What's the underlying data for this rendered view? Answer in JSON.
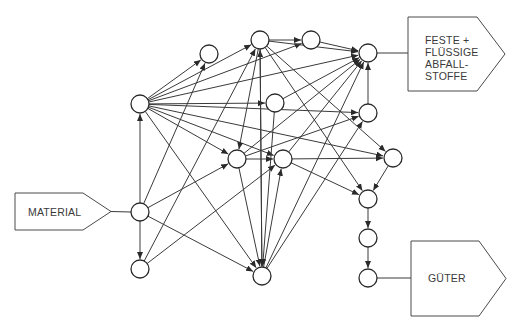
{
  "diagram": {
    "type": "process-flow-network",
    "labels": {
      "input": "MATERIAL",
      "waste_lines": [
        "FESTE +",
        "FLÜSSIGE",
        "ABFALL-",
        "STOFFE"
      ],
      "output": "GÜTER"
    },
    "boxes": [
      {
        "id": "material",
        "x": 15,
        "y": 193,
        "w": 68,
        "h": 37,
        "tip": 28,
        "dir": "right"
      },
      {
        "id": "waste",
        "x": 408,
        "y": 17,
        "w": 69,
        "h": 74,
        "tip": 28,
        "dir": "right"
      },
      {
        "id": "goods",
        "x": 411,
        "y": 241,
        "w": 68,
        "h": 75,
        "tip": 27,
        "dir": "right"
      }
    ],
    "nodes": [
      {
        "id": "A",
        "x": 140,
        "y": 104
      },
      {
        "id": "B",
        "x": 209,
        "y": 54
      },
      {
        "id": "C",
        "x": 260,
        "y": 40
      },
      {
        "id": "D",
        "x": 311,
        "y": 40
      },
      {
        "id": "E",
        "x": 368,
        "y": 53
      },
      {
        "id": "F",
        "x": 275,
        "y": 103
      },
      {
        "id": "G",
        "x": 237,
        "y": 159
      },
      {
        "id": "H",
        "x": 283,
        "y": 159
      },
      {
        "id": "I",
        "x": 368,
        "y": 113
      },
      {
        "id": "J",
        "x": 393,
        "y": 158
      },
      {
        "id": "K",
        "x": 140,
        "y": 212
      },
      {
        "id": "L",
        "x": 140,
        "y": 269
      },
      {
        "id": "M",
        "x": 262,
        "y": 276
      },
      {
        "id": "N",
        "x": 368,
        "y": 199
      },
      {
        "id": "O",
        "x": 368,
        "y": 238
      },
      {
        "id": "P",
        "x": 368,
        "y": 278
      }
    ],
    "edges": [
      [
        "A",
        "B"
      ],
      [
        "A",
        "C"
      ],
      [
        "A",
        "D"
      ],
      [
        "A",
        "E"
      ],
      [
        "A",
        "F"
      ],
      [
        "A",
        "G"
      ],
      [
        "A",
        "H"
      ],
      [
        "A",
        "I"
      ],
      [
        "A",
        "J"
      ],
      [
        "A",
        "M"
      ],
      [
        "K",
        "A"
      ],
      [
        "K",
        "L"
      ],
      [
        "K",
        "B"
      ],
      [
        "K",
        "G"
      ],
      [
        "K",
        "M"
      ],
      [
        "L",
        "C"
      ],
      [
        "L",
        "H"
      ],
      [
        "M",
        "C"
      ],
      [
        "M",
        "E"
      ],
      [
        "M",
        "I"
      ],
      [
        "M",
        "H"
      ],
      [
        "C",
        "D"
      ],
      [
        "C",
        "M"
      ],
      [
        "C",
        "E"
      ],
      [
        "C",
        "N"
      ],
      [
        "C",
        "J"
      ],
      [
        "C",
        "G"
      ],
      [
        "D",
        "E"
      ],
      [
        "F",
        "E"
      ],
      [
        "F",
        "M"
      ],
      [
        "G",
        "E"
      ],
      [
        "G",
        "H"
      ],
      [
        "G",
        "M"
      ],
      [
        "G",
        "I"
      ],
      [
        "H",
        "N"
      ],
      [
        "H",
        "J"
      ],
      [
        "H",
        "E"
      ],
      [
        "I",
        "E"
      ],
      [
        "J",
        "N"
      ],
      [
        "N",
        "O"
      ],
      [
        "O",
        "P"
      ]
    ],
    "lines": [
      [
        "K",
        "material"
      ],
      [
        "E",
        "waste"
      ],
      [
        "P",
        "goods"
      ]
    ]
  }
}
